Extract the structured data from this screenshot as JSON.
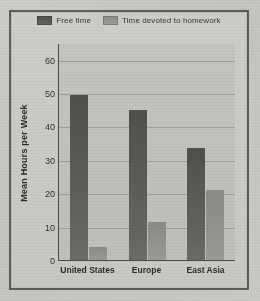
{
  "chart_data": {
    "type": "bar",
    "title": "",
    "xlabel": "",
    "ylabel": "Mean Hours per Week",
    "categories": [
      "United States",
      "Europe",
      "East Asia"
    ],
    "series": [
      {
        "name": "Free time",
        "values": [
          49.5,
          45,
          33.5
        ],
        "color": "#5a5a57"
      },
      {
        "name": "Time devoted to homework",
        "values": [
          4,
          11.5,
          21
        ],
        "color": "#919189"
      }
    ],
    "ylim": [
      0,
      65
    ],
    "yticks": [
      0,
      10,
      20,
      30,
      40,
      50,
      60
    ],
    "ytick_labels": [
      "0",
      "10",
      "20",
      "30",
      "40",
      "50",
      "60"
    ],
    "grid": true,
    "legend_position": "top-center"
  },
  "legend": {
    "items": [
      {
        "label": "Free time",
        "swatch": "#5a5a57"
      },
      {
        "label": "Time devoted to homework",
        "swatch": "#919189"
      }
    ]
  },
  "colors": {
    "page_background": "#c9c9c4",
    "plot_background": "#c2c2bd",
    "frame_border": "#5c5c58",
    "gridline": "#9d9d98",
    "axis": "#4a4a47",
    "text": "#2d2d30"
  }
}
